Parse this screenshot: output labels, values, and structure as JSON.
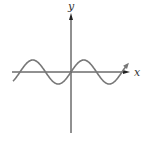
{
  "chart_data": {
    "type": "line",
    "title": "",
    "xlabel": "x",
    "ylabel": "y",
    "function": "sin(x)",
    "series": [
      {
        "name": "y = sin x",
        "x": [
          -4.71,
          -3.14,
          -1.57,
          0,
          1.57,
          3.14,
          4.71,
          5.5
        ],
        "values": [
          1,
          0,
          -1,
          0,
          1,
          0,
          -1,
          -0.7
        ]
      }
    ],
    "grid": false,
    "legend": null,
    "ticks": "none",
    "colors": {
      "axis": "#222222",
      "curve": "#777777"
    }
  },
  "axes": {
    "x_label": "x",
    "y_label": "y"
  }
}
